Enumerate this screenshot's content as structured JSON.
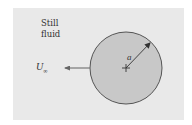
{
  "figure": {
    "background_label": "Still\nfluid",
    "velocity_label": "U",
    "velocity_subscript": "∞",
    "radius_label": "a",
    "colors": {
      "panel": "#e9e9e9",
      "sphere_fill": "#c8c8c8",
      "sphere_stroke": "#555555",
      "arrow": "#666666",
      "text": "#333333"
    },
    "sphere": {
      "center_x": 126,
      "center_y": 68,
      "radius": 36
    }
  }
}
